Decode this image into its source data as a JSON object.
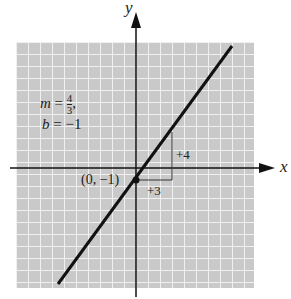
{
  "axes": {
    "x_label": "x",
    "y_label": "y"
  },
  "annotations": {
    "slope_label": "m =",
    "slope_num": "4",
    "slope_den": "3",
    "slope_suffix": ",",
    "intercept_label": "b = −1",
    "point_label": "(0, −1)",
    "rise_label": "+4",
    "run_label": "+3"
  },
  "line": {
    "slope": "4/3",
    "intercept": -1,
    "point": [
      0,
      -1
    ]
  },
  "colors": {
    "grid_bg": "#c8c8c8",
    "grid_line": "#f2f2f2",
    "ink": "#111111"
  }
}
